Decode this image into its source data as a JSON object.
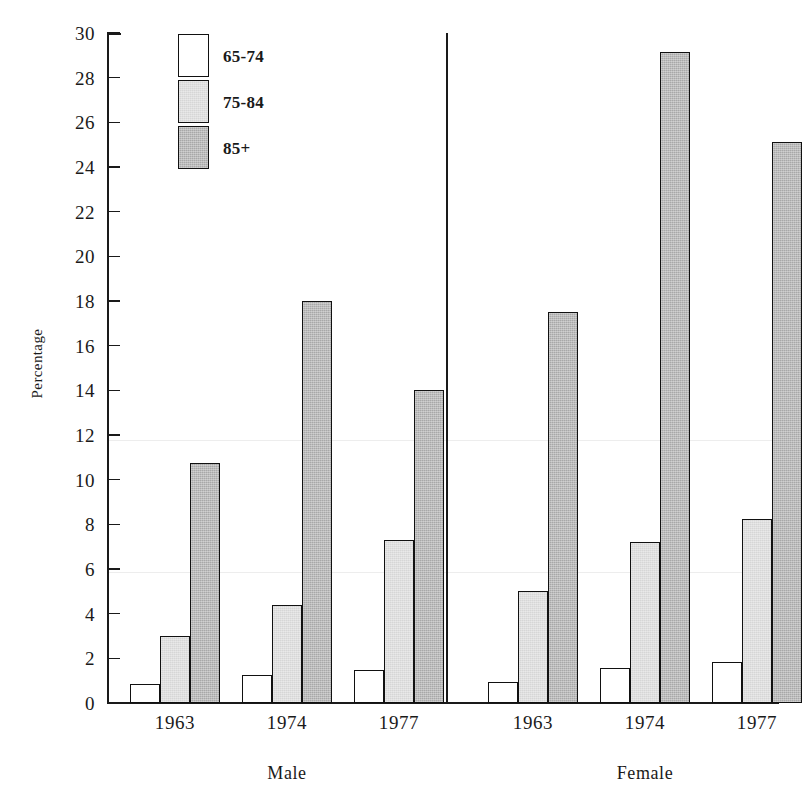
{
  "chart_data": {
    "type": "bar",
    "title": "",
    "xlabel": "",
    "ylabel": "Percentage",
    "ylim": [
      0,
      30
    ],
    "ytick_step": 2,
    "yticks": [
      0,
      2,
      4,
      6,
      8,
      10,
      12,
      14,
      16,
      18,
      20,
      22,
      24,
      26,
      28,
      30
    ],
    "grid": false,
    "legend_position": "upper-left-inside",
    "categories": [
      "1963",
      "1974",
      "1977"
    ],
    "panels": [
      {
        "name": "Male",
        "categories": [
          "1963",
          "1974",
          "1977"
        ],
        "series": [
          {
            "name": "65-74",
            "values": [
              0.85,
              1.25,
              1.5
            ]
          },
          {
            "name": "75-84",
            "values": [
              3.0,
              4.4,
              7.3
            ]
          },
          {
            "name": "85+",
            "values": [
              10.75,
              18.0,
              14.0
            ]
          }
        ]
      },
      {
        "name": "Female",
        "categories": [
          "1963",
          "1974",
          "1977"
        ],
        "series": [
          {
            "name": "65-74",
            "values": [
              0.95,
              1.55,
              1.85
            ]
          },
          {
            "name": "75-84",
            "values": [
              5.0,
              7.2,
              8.25
            ]
          },
          {
            "name": "85+",
            "values": [
              17.5,
              29.15,
              25.1
            ]
          }
        ]
      }
    ],
    "series_names": [
      "65-74",
      "75-84",
      "85+"
    ],
    "series_colors": [
      "#ffffff",
      "#d6d6d6",
      "#a8a8a8"
    ]
  },
  "legend": {
    "items": [
      {
        "label": "65-74",
        "swatch": "white"
      },
      {
        "label": "75-84",
        "swatch": "light-gray"
      },
      {
        "label": "85+",
        "swatch": "dark-gray"
      }
    ]
  },
  "axis": {
    "y_title": "Percentage",
    "y_labels": [
      "30",
      "28",
      "26",
      "24",
      "22",
      "20",
      "18",
      "16",
      "14",
      "12",
      "10",
      "8",
      "6",
      "4",
      "2",
      "0"
    ]
  },
  "x_labels": {
    "male": [
      "1963",
      "1974",
      "1977"
    ],
    "female": [
      "1963",
      "1974",
      "1977"
    ],
    "groups": [
      "Male",
      "Female"
    ]
  },
  "artifacts": {
    "top_title_remnant": "˜ ˜ ˜ ˜ ˜"
  }
}
